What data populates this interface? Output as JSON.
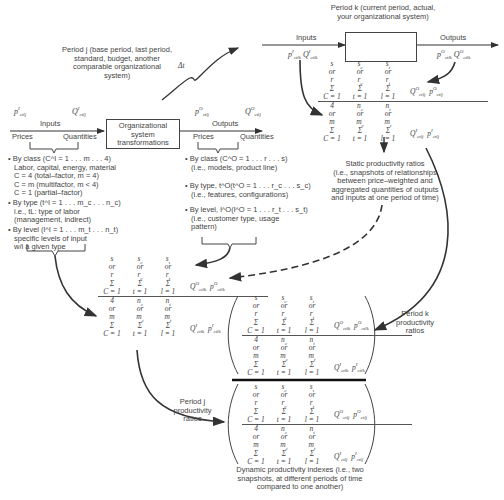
{
  "period_j_title": "Period j (base period, last period, standard, budget, another comparable organizational system)",
  "period_j_lines": [
    "Period j (base period, last period,",
    "standard, budget, another",
    "comparable organizational",
    "system)"
  ],
  "period_k_lines": [
    "Period k (current period, actual,",
    "your organizational system)"
  ],
  "delta_t": "Δt",
  "left_system": {
    "box_lines": [
      "Organizational",
      "system",
      "transformations"
    ],
    "inputs_label": "Inputs",
    "outputs_label": "Outputs",
    "prices_label": "Prices",
    "quantities_label": "Quantities",
    "input_price_symbol": "p^I_ctlj",
    "input_quantity_symbol": "Q^I_ctlj",
    "output_price_symbol": "p^O_ctlj",
    "output_quantity_symbol": "Q^O_ctlj"
  },
  "right_system": {
    "inputs_label": "Inputs",
    "outputs_label": "Outputs",
    "input_symbols": "p^I_ctlk Q^I_ctlk",
    "output_symbols": "p^O_ctlk Q^O_ctlk"
  },
  "input_classifications": [
    [
      "• By class (C^I = 1 . . . m . . . 4)",
      "Labor, capital, energy, material",
      "C = 4 (total–factor, m = 4)",
      "C = m (multifactor, m < 4)",
      "C = 1 (partial–factor)"
    ],
    [
      "• By type (t^I = 1 . . . m_c . . . n_c)",
      "i.e., tL: type of labor",
      "(management, indirect)"
    ],
    [
      "• By level (l^I = 1 . . . m_t . . . n_t)",
      "specific levels of input",
      "w/i a given type"
    ]
  ],
  "output_classifications": [
    [
      "• By class (C^O = 1 . . . r . . . s)",
      "(i.e., models, product line)"
    ],
    [
      "• By type, t^O(t^O = 1 . . . r_c . . . s_c)",
      "(i.e., features, configurations)"
    ],
    [
      "• By level, l^O(l^O = 1 . . . r_t . . . s_t)",
      "(i.e., customer type, usage",
      "pattern)"
    ]
  ],
  "static_ratio_note": [
    "Static productivity ratios",
    "(i.e., snapshots of relationships",
    "between price–weighted and",
    "aggregated quantities of outputs",
    "and inputs at one period of time)"
  ],
  "period_k_ratios_label": [
    "Period k",
    "productivity",
    "ratios"
  ],
  "period_j_ratios_label": [
    "Period j",
    "productivity",
    "ratios"
  ],
  "dynamic_note": [
    "Dynamic productivity indexes (i.e., two",
    "snapshots, at different periods of time",
    "compared to one another)"
  ],
  "fraction": {
    "numerator_rows": [
      [
        "s",
        "s_c",
        "s_t"
      ],
      [
        "or",
        "or",
        "or"
      ],
      [
        "r",
        "r_c",
        "r_t"
      ],
      [
        "Σ",
        "Σ",
        "Σ"
      ]
    ],
    "denominator_rows": [
      [
        "4",
        "n_c",
        "n_t"
      ],
      [
        "or",
        "or",
        "or"
      ],
      [
        "m",
        "m_c",
        "m_t"
      ],
      [
        "Σ",
        "Σ",
        "Σ"
      ]
    ],
    "limits": [
      "C = 1",
      "t = 1",
      "l = 1"
    ]
  },
  "ratio_k_top": {
    "num_terms": "Q^O_ctlj  p^O_ctlj",
    "den_terms": "Q^I_ctlj  p^I_ctlj"
  },
  "ratio_j_left": {
    "num_terms": "Q^O_ctlk  p^O_ctlk",
    "den_terms": "Q^I_ctlk  p^I_ctlk"
  },
  "dyn_top": {
    "num_terms": "Q^O_ctlk  p^O_ctlk",
    "den_terms": "Q^I_ctlk  p^I_ctlk"
  },
  "dyn_bottom": {
    "num_terms": "Q^O_ctlj  p^O_ctlj",
    "den_terms": "Q^I_ctlj  p^I_ctlj"
  }
}
